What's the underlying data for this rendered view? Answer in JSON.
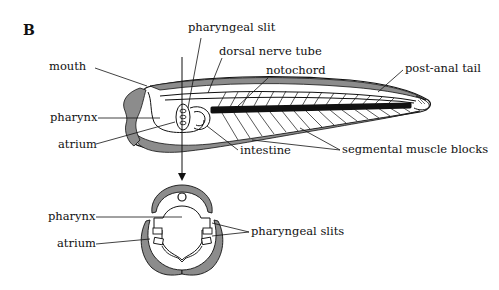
{
  "figure": {
    "panel_label": "B",
    "colors": {
      "shade": "#8c8c8c",
      "ink": "#111111",
      "background": "#ffffff"
    }
  },
  "side_view": {
    "labels": {
      "pharyngeal_slit": "pharyngeal slit",
      "dorsal_nerve_tube": "dorsal nerve tube",
      "notochord": "notochord",
      "post_anal_tail": "post-anal tail",
      "mouth": "mouth",
      "pharynx": "pharynx",
      "atrium": "atrium",
      "intestine": "intestine",
      "segmental_muscle_blocks": "segmental muscle blocks"
    }
  },
  "cross_section": {
    "labels": {
      "pharynx": "pharynx",
      "atrium": "atrium",
      "pharyngeal_slits": "pharyngeal slits"
    }
  }
}
